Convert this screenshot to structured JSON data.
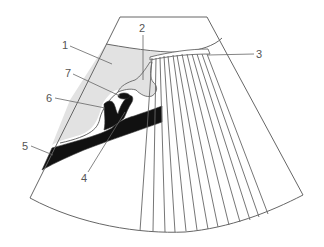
{
  "figure": {
    "type": "ultrasound-sector-schematic",
    "colors": {
      "background": "#ffffff",
      "outline": "#666666",
      "shaded_region": "#e2e2e2",
      "dark_structure": "#111111",
      "label_text": "#555555"
    },
    "labels": [
      {
        "id": "1",
        "text": "1",
        "x": 62,
        "y": 49,
        "leader_to": [
          112,
          64
        ]
      },
      {
        "id": "2",
        "text": "2",
        "x": 139,
        "y": 32,
        "leader_to": [
          143,
          80
        ]
      },
      {
        "id": "3",
        "text": "3",
        "x": 256,
        "y": 58,
        "leader_to": [
          208,
          55
        ]
      },
      {
        "id": "4",
        "text": "4",
        "x": 81,
        "y": 182,
        "leader_to": [
          125,
          112
        ]
      },
      {
        "id": "5",
        "text": "5",
        "x": 22,
        "y": 150,
        "leader_to": [
          53,
          155
        ]
      },
      {
        "id": "6",
        "text": "6",
        "x": 46,
        "y": 102,
        "leader_to": [
          105,
          108
        ]
      },
      {
        "id": "7",
        "text": "7",
        "x": 65,
        "y": 77,
        "leader_to": [
          120,
          96
        ]
      }
    ],
    "fan_line_count": 13
  }
}
